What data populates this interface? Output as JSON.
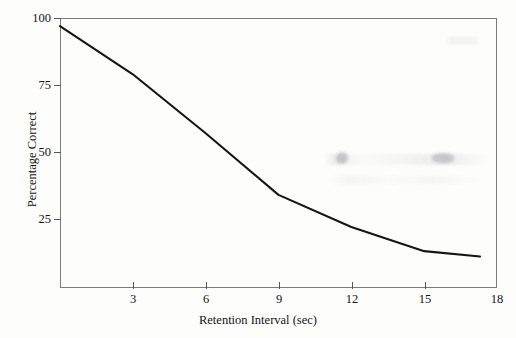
{
  "chart_data": {
    "type": "line",
    "title": "",
    "xlabel": "Retention Interval (sec)",
    "ylabel": "Percentage Correct",
    "xlim": [
      0,
      18
    ],
    "ylim": [
      0,
      100
    ],
    "grid": false,
    "legend": null,
    "xticks": [
      3,
      6,
      9,
      12,
      15,
      18
    ],
    "yticks": [
      25,
      50,
      75,
      100
    ],
    "series": [
      {
        "name": "Recall accuracy",
        "color": "#151515",
        "x": [
          0,
          3,
          6,
          9,
          12,
          15,
          17.3
        ],
        "values": [
          97,
          79,
          57,
          34,
          22,
          13,
          11
        ]
      }
    ]
  },
  "axes": {
    "y_title": "Percentage Correct",
    "x_title": "Retention Interval (sec)",
    "y_tick_labels": [
      {
        "value": 100,
        "label": "100"
      },
      {
        "value": 75,
        "label": "75"
      },
      {
        "value": 50,
        "label": "50"
      },
      {
        "value": 25,
        "label": "25"
      }
    ],
    "x_tick_labels": [
      {
        "value": 3,
        "label": "3"
      },
      {
        "value": 6,
        "label": "6"
      },
      {
        "value": 9,
        "label": "9"
      },
      {
        "value": 12,
        "label": "12"
      },
      {
        "value": 15,
        "label": "15"
      },
      {
        "value": 18,
        "label": "18"
      }
    ]
  },
  "style": {
    "frame_color": "#7c7c7c",
    "line_color": "#151515",
    "text_color": "#141414",
    "background": "#fdfdfc"
  }
}
